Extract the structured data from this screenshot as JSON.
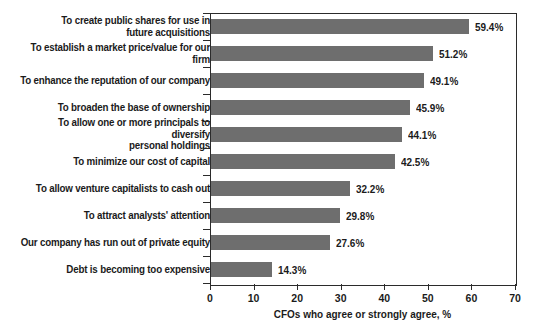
{
  "chart_data": {
    "type": "bar",
    "orientation": "horizontal",
    "title": "",
    "xlabel": "CFOs who agree or strongly agree, %",
    "ylabel": "",
    "xlim": [
      0,
      70
    ],
    "xticks": [
      0,
      10,
      20,
      30,
      40,
      50,
      60,
      70
    ],
    "grid": false,
    "legend": false,
    "bar_color": "#6e6e6e",
    "axis_color": "#2b2b2b",
    "text_color": "#1b1b1b",
    "value_suffix": "%",
    "categories": [
      "To create public shares for use in\nfuture acquisitions",
      "To establish a market price/value for our firm",
      "To enhance the reputation of our company",
      "To broaden the base of ownership",
      "To allow one or more principals to diversify\npersonal holdings",
      "To minimize our cost of capital",
      "To allow venture capitalists to cash out",
      "To attract analysts' attention",
      "Our company has run out of private equity",
      "Debt is becoming too expensive"
    ],
    "values": [
      59.4,
      51.2,
      49.1,
      45.9,
      44.1,
      42.5,
      32.2,
      29.8,
      27.6,
      14.3
    ],
    "value_labels": [
      "59.4%",
      "51.2%",
      "49.1%",
      "45.9%",
      "44.1%",
      "42.5%",
      "32.2%",
      "29.8%",
      "27.6%",
      "14.3%"
    ],
    "xtick_labels": [
      "0",
      "10",
      "20",
      "30",
      "40",
      "50",
      "60",
      "70"
    ]
  }
}
